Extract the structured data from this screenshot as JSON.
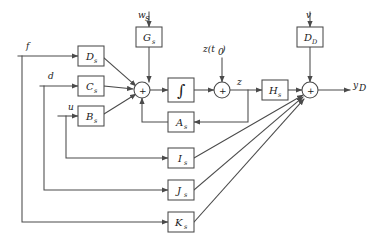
{
  "diagram": {
    "line_color": "#4a4a4a",
    "box_fill": "#ffffff",
    "text_color": "#1a1a1a",
    "integrator_glyph": "∫",
    "sum_glyph": "+",
    "blocks": [
      {
        "id": "Ds",
        "base": "D",
        "sub": "s",
        "x": 78,
        "y": 46,
        "w": 26,
        "h": 20
      },
      {
        "id": "Cs",
        "base": "C",
        "sub": "s",
        "x": 78,
        "y": 76,
        "w": 26,
        "h": 20
      },
      {
        "id": "Bs",
        "base": "B",
        "sub": "s",
        "x": 78,
        "y": 106,
        "w": 26,
        "h": 20
      },
      {
        "id": "Gs",
        "base": "G",
        "sub": "s",
        "x": 136,
        "y": 27,
        "w": 26,
        "h": 20
      },
      {
        "id": "As",
        "base": "A",
        "sub": "s",
        "x": 168,
        "y": 112,
        "w": 26,
        "h": 20
      },
      {
        "id": "Is",
        "base": "I",
        "sub": "s",
        "x": 168,
        "y": 148,
        "w": 26,
        "h": 20
      },
      {
        "id": "Js",
        "base": "J",
        "sub": "s",
        "x": 168,
        "y": 180,
        "w": 26,
        "h": 20
      },
      {
        "id": "Ks",
        "base": "K",
        "sub": "s",
        "x": 168,
        "y": 212,
        "w": 26,
        "h": 20
      },
      {
        "id": "Hs",
        "base": "H",
        "sub": "s",
        "x": 262,
        "y": 80,
        "w": 26,
        "h": 20
      },
      {
        "id": "DD",
        "base": "D",
        "sub": "D",
        "x": 297,
        "y": 27,
        "w": 26,
        "h": 20
      },
      {
        "id": "integrator",
        "base": "∫",
        "sub": "",
        "x": 168,
        "y": 78,
        "w": 26,
        "h": 24
      }
    ],
    "summers": [
      {
        "id": "sum-state",
        "cx": 142,
        "cy": 90,
        "r": 8,
        "sign": "+"
      },
      {
        "id": "sum-z",
        "cx": 222,
        "cy": 90,
        "r": 8,
        "sign": "+"
      },
      {
        "id": "sum-out",
        "cx": 310,
        "cy": 90,
        "r": 8,
        "sign": "+"
      }
    ],
    "signals": [
      {
        "id": "f",
        "text": "f",
        "sub": "",
        "x": 26,
        "y": 49
      },
      {
        "id": "d",
        "text": "d",
        "sub": "",
        "x": 48,
        "y": 79
      },
      {
        "id": "u",
        "text": "u",
        "sub": "",
        "x": 68,
        "y": 110
      },
      {
        "id": "ws",
        "text": "w",
        "sub": "s",
        "x": 139,
        "y": 18
      },
      {
        "id": "v",
        "text": "v",
        "sub": "",
        "x": 306,
        "y": 18
      },
      {
        "id": "zt0",
        "text": "z(t",
        "sub": "0",
        "x": 205,
        "y": 52,
        "tail": ")"
      },
      {
        "id": "z",
        "text": "z",
        "sub": "",
        "x": 237,
        "y": 85
      },
      {
        "id": "yD",
        "text": "y",
        "sub": "D",
        "x": 353,
        "y": 88
      }
    ]
  }
}
